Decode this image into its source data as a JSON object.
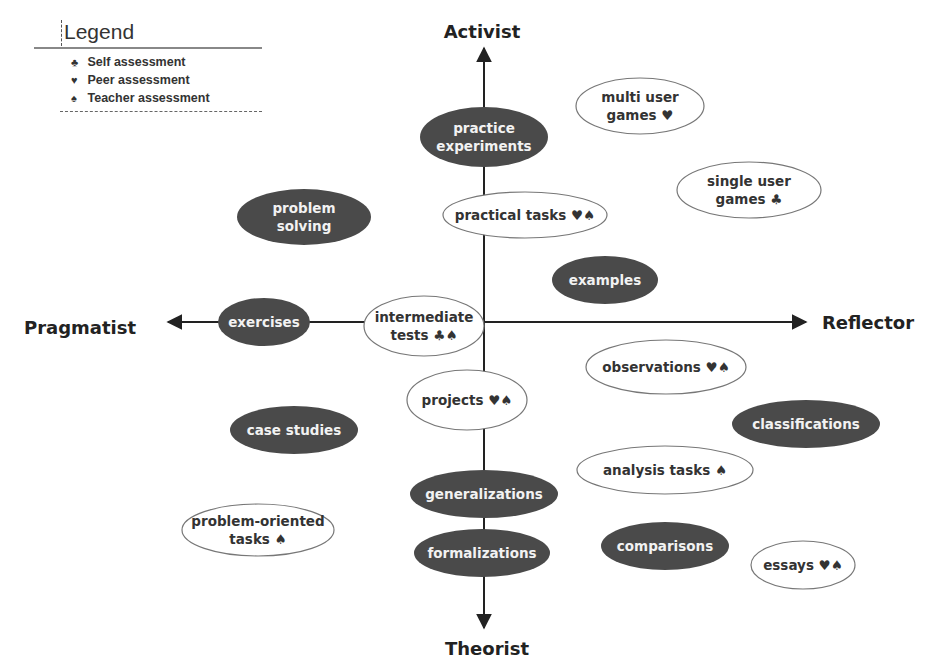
{
  "legend": {
    "title": "Legend",
    "items": [
      {
        "symbol": "♣",
        "symbol_name": "club-icon",
        "label": "Self assessment"
      },
      {
        "symbol": "♥",
        "symbol_name": "heart-icon",
        "label": "Peer assessment"
      },
      {
        "symbol": "♠",
        "symbol_name": "spade-icon",
        "label": "Teacher assessment"
      }
    ]
  },
  "axes": {
    "top": "Activist",
    "bottom": "Theorist",
    "left": "Pragmatist",
    "right": "Reflector"
  },
  "colors": {
    "dark_node": "#4a4a4a",
    "light_node_fill": "#ffffff",
    "light_node_stroke": "#777777",
    "axis": "#222222"
  },
  "nodes": [
    {
      "id": "practice-experiments",
      "lines": [
        "practice",
        "experiments"
      ],
      "style": "dark",
      "cx": 484,
      "cy": 137,
      "rx": 64,
      "ry": 30
    },
    {
      "id": "practical-tasks",
      "lines": [
        "practical tasks ♥♠"
      ],
      "style": "light",
      "cx": 525,
      "cy": 215,
      "rx": 82,
      "ry": 23
    },
    {
      "id": "multi-user-games",
      "lines": [
        "multi user",
        "games ♥"
      ],
      "style": "light",
      "cx": 640,
      "cy": 106,
      "rx": 64,
      "ry": 28
    },
    {
      "id": "single-user-games",
      "lines": [
        "single user",
        "games ♣"
      ],
      "style": "light",
      "cx": 749,
      "cy": 190,
      "rx": 72,
      "ry": 28
    },
    {
      "id": "problem-solving",
      "lines": [
        "problem",
        "solving"
      ],
      "style": "dark",
      "cx": 304,
      "cy": 217,
      "rx": 67,
      "ry": 28
    },
    {
      "id": "examples",
      "lines": [
        "examples"
      ],
      "style": "dark",
      "cx": 605,
      "cy": 280,
      "rx": 53,
      "ry": 24
    },
    {
      "id": "exercises",
      "lines": [
        "exercises"
      ],
      "style": "dark",
      "cx": 264,
      "cy": 322,
      "rx": 46,
      "ry": 24
    },
    {
      "id": "intermediate-tests",
      "lines": [
        "intermediate",
        "tests ♣♠"
      ],
      "style": "light",
      "cx": 424,
      "cy": 326,
      "rx": 60,
      "ry": 30
    },
    {
      "id": "observations",
      "lines": [
        "observations ♥♠"
      ],
      "style": "light",
      "cx": 666,
      "cy": 367,
      "rx": 80,
      "ry": 27
    },
    {
      "id": "projects",
      "lines": [
        "projects ♥♠"
      ],
      "style": "light",
      "cx": 467,
      "cy": 400,
      "rx": 60,
      "ry": 30
    },
    {
      "id": "case-studies",
      "lines": [
        "case studies"
      ],
      "style": "dark",
      "cx": 294,
      "cy": 430,
      "rx": 64,
      "ry": 24
    },
    {
      "id": "classifications",
      "lines": [
        "classifications"
      ],
      "style": "dark",
      "cx": 806,
      "cy": 424,
      "rx": 74,
      "ry": 24
    },
    {
      "id": "analysis-tasks",
      "lines": [
        "analysis tasks ♠"
      ],
      "style": "light",
      "cx": 665,
      "cy": 470,
      "rx": 88,
      "ry": 24
    },
    {
      "id": "generalizations",
      "lines": [
        "generalizations"
      ],
      "style": "dark",
      "cx": 484,
      "cy": 494,
      "rx": 74,
      "ry": 24
    },
    {
      "id": "problem-oriented-tasks",
      "lines": [
        "problem-oriented",
        "tasks ♠"
      ],
      "style": "light",
      "cx": 258,
      "cy": 530,
      "rx": 76,
      "ry": 26
    },
    {
      "id": "formalizations",
      "lines": [
        "formalizations"
      ],
      "style": "dark",
      "cx": 482,
      "cy": 553,
      "rx": 68,
      "ry": 24
    },
    {
      "id": "comparisons",
      "lines": [
        "comparisons"
      ],
      "style": "dark",
      "cx": 665,
      "cy": 546,
      "rx": 64,
      "ry": 24
    },
    {
      "id": "essays",
      "lines": [
        "essays ♥♠"
      ],
      "style": "light",
      "cx": 803,
      "cy": 565,
      "rx": 52,
      "ry": 24
    }
  ]
}
